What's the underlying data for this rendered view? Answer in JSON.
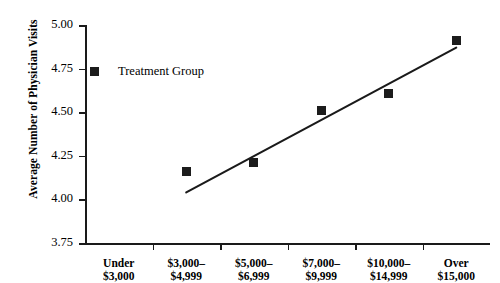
{
  "chart_data": {
    "type": "scatter",
    "title": "",
    "subtitle": "",
    "xlabel": "",
    "ylabel": "Average Number of Physician Visits",
    "categories": [
      "Under $3,000",
      "$3,000–$4,999",
      "$5,000–$6,999",
      "$7,000–$9,999",
      "$10,000–$14,999",
      "Over $15,000"
    ],
    "category_lines": [
      [
        "Under",
        "$3,000"
      ],
      [
        "$3,000–",
        "$4,999"
      ],
      [
        "$5,000–",
        "$6,999"
      ],
      [
        "$7,000–",
        "$9,999"
      ],
      [
        "$10,000–",
        "$14,999"
      ],
      [
        "Over",
        "$15,000"
      ]
    ],
    "series": [
      {
        "name": "Treatment Group",
        "marker": "square",
        "color": "#1c1c1c",
        "values": [
          null,
          4.16,
          4.21,
          4.51,
          4.61,
          4.91
        ]
      }
    ],
    "trendline": {
      "present": true,
      "x_start_category_index": 1,
      "x_end_category_index": 5,
      "y_start": 4.04,
      "y_end": 4.87,
      "color": "#1a1a1a"
    },
    "ylim": [
      3.75,
      5.0
    ],
    "yticks": [
      "3.75",
      "4.00",
      "4.25",
      "4.50",
      "4.75",
      "5.00"
    ],
    "ytick_values": [
      3.75,
      4.0,
      4.25,
      4.5,
      4.75,
      5.0
    ],
    "grid": false,
    "legend_position": "inside-top-left"
  },
  "legend": {
    "entries": [
      {
        "label": "Treatment Group",
        "color": "#1c1c1c"
      }
    ]
  },
  "axis": {
    "y_title": "Average Number of Physician Visits"
  }
}
